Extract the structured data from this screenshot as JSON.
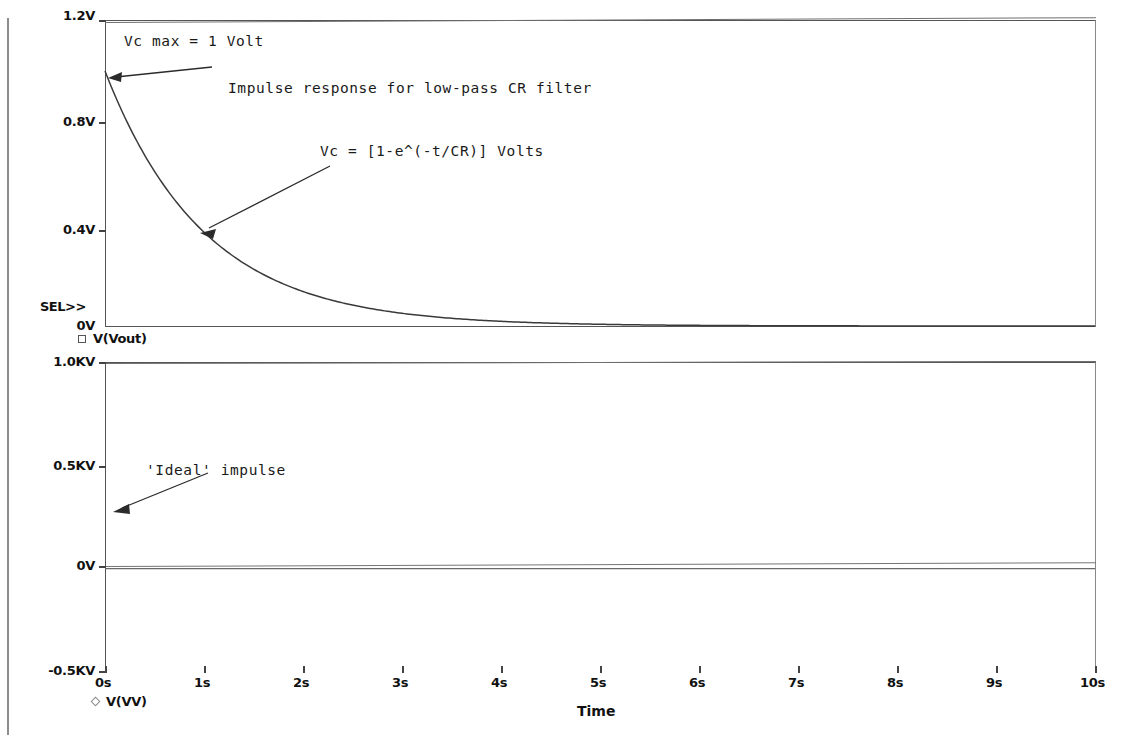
{
  "document": {
    "kind": "spice-probe-plot",
    "page_border_visible": true
  },
  "plots": {
    "top": {
      "y_axis": {
        "ticks": [
          {
            "label": "1.2V",
            "value": 1.2
          },
          {
            "label": "0.8V",
            "value": 0.8
          },
          {
            "label": "0.4V",
            "value": 0.4
          },
          {
            "label": "0V",
            "value": 0.0
          }
        ],
        "range": [
          0.0,
          1.2
        ],
        "selected_marker": "SEL>>"
      },
      "legend": [
        {
          "marker": "square",
          "label": "V(Vout)"
        }
      ],
      "annotations": [
        {
          "name": "vc-max",
          "text": "Vc max = 1 Volt"
        },
        {
          "name": "title",
          "text": "Impulse response for low-pass CR filter"
        },
        {
          "name": "equation",
          "text": "Vc = [1-e^(-t/CR)] Volts"
        }
      ]
    },
    "bottom": {
      "y_axis": {
        "ticks": [
          {
            "label": "1.0KV",
            "value": 1000
          },
          {
            "label": "0.5KV",
            "value": 500
          },
          {
            "label": "0V",
            "value": 0
          },
          {
            "label": "-0.5KV",
            "value": -500
          }
        ],
        "range": [
          -500,
          1000
        ]
      },
      "legend": [
        {
          "marker": "diamond",
          "label": "V(VV)"
        }
      ],
      "annotations": [
        {
          "name": "ideal-impulse",
          "text": "'Ideal' impulse"
        }
      ]
    }
  },
  "x_axis": {
    "title": "Time",
    "ticks": [
      "0s",
      "1s",
      "2s",
      "3s",
      "4s",
      "5s",
      "6s",
      "7s",
      "8s",
      "9s",
      "10s"
    ],
    "range": [
      0,
      10
    ],
    "unit": "s"
  },
  "chart_data": [
    {
      "type": "line",
      "name": "top-panel-vout",
      "title": "Impulse response for low-pass CR filter",
      "xlabel": "Time",
      "ylabel": "V(Vout)",
      "xlim": [
        0,
        10
      ],
      "ylim": [
        0,
        1.2
      ],
      "grid": false,
      "legend": [
        "V(Vout)"
      ],
      "xticks": [
        0,
        1,
        2,
        3,
        4,
        5,
        6,
        7,
        8,
        9,
        10
      ],
      "xticklabels": [
        "0s",
        "1s",
        "2s",
        "3s",
        "4s",
        "5s",
        "6s",
        "7s",
        "8s",
        "9s",
        "10s"
      ],
      "yticks": [
        0,
        0.4,
        0.8,
        1.2
      ],
      "yticklabels": [
        "0V",
        "0.4V",
        "0.8V",
        "1.2V"
      ],
      "series": [
        {
          "name": "V(Vout)",
          "equation": "Vc = e^(-t/CR), CR = 1 s",
          "x": [
            0,
            0.25,
            0.5,
            0.75,
            1,
            1.25,
            1.5,
            1.75,
            2,
            2.5,
            3,
            3.5,
            4,
            4.5,
            5,
            6,
            7,
            8,
            9,
            10
          ],
          "y": [
            1.0,
            0.779,
            0.607,
            0.472,
            0.368,
            0.287,
            0.223,
            0.174,
            0.135,
            0.082,
            0.05,
            0.03,
            0.018,
            0.011,
            0.0067,
            0.0025,
            0.0009,
            0.0003,
            0.0001,
            0.0
          ]
        }
      ]
    },
    {
      "type": "line",
      "name": "bottom-panel-vv",
      "title": "",
      "xlabel": "Time",
      "ylabel": "V(VV)",
      "xlim": [
        0,
        10
      ],
      "ylim": [
        -500,
        1000
      ],
      "grid": true,
      "legend": [
        "V(VV)"
      ],
      "xticks": [
        0,
        1,
        2,
        3,
        4,
        5,
        6,
        7,
        8,
        9,
        10
      ],
      "xticklabels": [
        "0s",
        "1s",
        "2s",
        "3s",
        "4s",
        "5s",
        "6s",
        "7s",
        "8s",
        "9s",
        "10s"
      ],
      "yticks": [
        -500,
        0,
        500,
        1000
      ],
      "yticklabels": [
        "-0.5KV",
        "0V",
        "0.5KV",
        "1.0KV"
      ],
      "series": [
        {
          "name": "V(VV)",
          "note": "ideal impulse: zero everywhere except an infinitesimal spike at t=0",
          "x": [
            0,
            1,
            2,
            3,
            4,
            5,
            6,
            7,
            8,
            9,
            10
          ],
          "y": [
            0,
            0,
            0,
            0,
            0,
            0,
            0,
            0,
            0,
            0,
            0
          ]
        }
      ]
    }
  ]
}
